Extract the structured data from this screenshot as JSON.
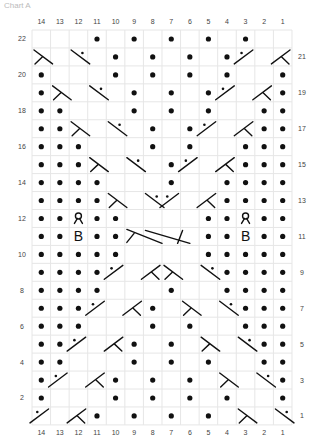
{
  "title": "Chart A",
  "grid": {
    "columns": 14,
    "rows": 22,
    "x0": 32,
    "y0": 30,
    "cell_w": 18.57,
    "cell_h": 17.95,
    "line_color": "#e6e6e6",
    "ink_color": "#111111"
  },
  "column_labels": [
    "14",
    "13",
    "12",
    "11",
    "10",
    "9",
    "8",
    "7",
    "6",
    "5",
    "4",
    "3",
    "2",
    "1"
  ],
  "legend_symbols": {
    "p": "purl (dot)",
    "lc": "left-leaning twist (\\ with stem)",
    "rc": "right-leaning twist (/ with stem)",
    "lcp": "left-leaning twist with purl (\\ with dot)",
    "rcp": "right-leaning twist with purl (/ with dot)",
    "yo": "yarn-over loop",
    "B": "bobble",
    "cl": "long cable left half",
    "cr": "long cable right half"
  },
  "rows": [
    {
      "n": 22,
      "label_side": "left",
      "cells": [
        "",
        "",
        "",
        "p",
        "",
        "p",
        "",
        "p",
        "",
        "p",
        "",
        "p",
        "",
        ""
      ]
    },
    {
      "n": 21,
      "label_side": "right",
      "cells": [
        "lc",
        "",
        "lcp",
        "",
        "p",
        "",
        "p",
        "",
        "p",
        "",
        "p",
        "rcp",
        "",
        "rc"
      ]
    },
    {
      "n": 20,
      "label_side": "left",
      "cells": [
        "p",
        "",
        "",
        "",
        "p",
        "",
        "p",
        "",
        "p",
        "",
        "p",
        "",
        "",
        "p"
      ]
    },
    {
      "n": 19,
      "label_side": "right",
      "cells": [
        "p",
        "lc",
        "",
        "lcp",
        "",
        "p",
        "",
        "p",
        "",
        "p",
        "rcp",
        "",
        "rc",
        "p"
      ]
    },
    {
      "n": 18,
      "label_side": "left",
      "cells": [
        "p",
        "p",
        "",
        "",
        "",
        "p",
        "",
        "p",
        "",
        "p",
        "",
        "",
        "p",
        "p"
      ]
    },
    {
      "n": 17,
      "label_side": "right",
      "cells": [
        "p",
        "p",
        "lc",
        "",
        "lcp",
        "",
        "p",
        "",
        "p",
        "rcp",
        "",
        "rc",
        "p",
        "p"
      ]
    },
    {
      "n": 16,
      "label_side": "left",
      "cells": [
        "p",
        "p",
        "p",
        "",
        "",
        "",
        "p",
        "",
        "p",
        "",
        "",
        "p",
        "p",
        "p"
      ]
    },
    {
      "n": 15,
      "label_side": "right",
      "cells": [
        "p",
        "p",
        "p",
        "lc",
        "",
        "lcp",
        "",
        "p",
        "rcp",
        "",
        "rc",
        "p",
        "p",
        "p"
      ]
    },
    {
      "n": 14,
      "label_side": "left",
      "cells": [
        "p",
        "p",
        "p",
        "p",
        "",
        "",
        "",
        "p",
        "",
        "",
        "p",
        "p",
        "p",
        "p"
      ]
    },
    {
      "n": 13,
      "label_side": "right",
      "cells": [
        "p",
        "p",
        "p",
        "p",
        "lc",
        "",
        "lcp",
        "rcp",
        "",
        "rc",
        "p",
        "p",
        "p",
        "p"
      ]
    },
    {
      "n": 12,
      "label_side": "left",
      "cells": [
        "p",
        "p",
        "yo",
        "p",
        "p",
        "",
        "",
        "",
        "",
        "p",
        "p",
        "yo",
        "p",
        "p"
      ]
    },
    {
      "n": 11,
      "label_side": "right",
      "cells": [
        "p",
        "p",
        "B",
        "p",
        "p",
        "cl",
        "",
        "cr",
        "",
        "p",
        "p",
        "B",
        "p",
        "p"
      ]
    },
    {
      "n": 10,
      "label_side": "left",
      "cells": [
        "p",
        "p",
        "p",
        "p",
        "p",
        "",
        "",
        "",
        "",
        "p",
        "p",
        "p",
        "p",
        "p"
      ]
    },
    {
      "n": 9,
      "label_side": "right",
      "cells": [
        "p",
        "p",
        "p",
        "p",
        "rcp",
        "",
        "rc",
        "lc",
        "",
        "lcp",
        "p",
        "p",
        "p",
        "p"
      ]
    },
    {
      "n": 8,
      "label_side": "left",
      "cells": [
        "p",
        "p",
        "p",
        "p",
        "",
        "",
        "",
        "p",
        "",
        "",
        "p",
        "p",
        "p",
        "p"
      ]
    },
    {
      "n": 7,
      "label_side": "right",
      "cells": [
        "p",
        "p",
        "p",
        "rcp",
        "",
        "rc",
        "p",
        "",
        "lc",
        "",
        "lcp",
        "p",
        "p",
        "p"
      ]
    },
    {
      "n": 6,
      "label_side": "left",
      "cells": [
        "p",
        "p",
        "p",
        "",
        "",
        "",
        "p",
        "",
        "p",
        "",
        "",
        "p",
        "p",
        "p"
      ]
    },
    {
      "n": 5,
      "label_side": "right",
      "cells": [
        "p",
        "p",
        "rcp",
        "",
        "rc",
        "p",
        "",
        "p",
        "",
        "lc",
        "",
        "lcp",
        "p",
        "p"
      ]
    },
    {
      "n": 4,
      "label_side": "left",
      "cells": [
        "p",
        "p",
        "",
        "",
        "",
        "p",
        "",
        "p",
        "",
        "p",
        "",
        "",
        "p",
        "p"
      ]
    },
    {
      "n": 3,
      "label_side": "right",
      "cells": [
        "p",
        "rcp",
        "",
        "rc",
        "p",
        "",
        "p",
        "",
        "p",
        "",
        "lc",
        "",
        "lcp",
        "p"
      ]
    },
    {
      "n": 2,
      "label_side": "left",
      "cells": [
        "p",
        "",
        "",
        "",
        "p",
        "",
        "p",
        "",
        "p",
        "",
        "p",
        "",
        "",
        "p"
      ]
    },
    {
      "n": 1,
      "label_side": "right",
      "cells": [
        "rcp",
        "",
        "rc",
        "p",
        "",
        "p",
        "",
        "p",
        "",
        "p",
        "",
        "lc",
        "",
        "lcp"
      ]
    }
  ]
}
